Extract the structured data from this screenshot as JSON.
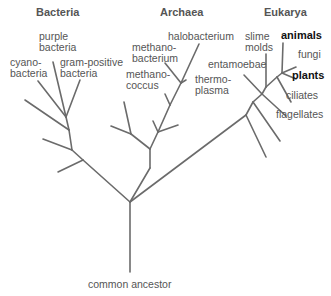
{
  "diagram": {
    "type": "phylogenetic-tree",
    "line_color": "#6b6b6b",
    "text_color": "#555555",
    "emphasis_color": "#111111",
    "domains": [
      {
        "name": "Bacteria"
      },
      {
        "name": "Archaea"
      },
      {
        "name": "Eukarya"
      }
    ],
    "root_label": "common ancestor",
    "leaves": {
      "bacteria": {
        "purple": "purple\nbacteria",
        "purple_l1": "purple",
        "purple_l2": "bacteria",
        "cyano_l1": "cyano-",
        "cyano_l2": "bacteria",
        "gram_l1": "gram-positive",
        "gram_l2": "bacteria"
      },
      "archaea": {
        "halo": "halobacterium",
        "methanobact_l1": "methano-",
        "methanobact_l2": "bacterium",
        "methanococ_l1": "methano-",
        "methanococ_l2": "coccus",
        "thermo_l1": "thermo-",
        "thermo_l2": "plasma"
      },
      "eukarya": {
        "slime_l1": "slime",
        "slime_l2": "molds",
        "animals": "animals",
        "fungi": "fungi",
        "plants": "plants",
        "entamoebae": "entamoebae",
        "ciliates": "ciliates",
        "flagellates": "flagellates"
      }
    }
  }
}
